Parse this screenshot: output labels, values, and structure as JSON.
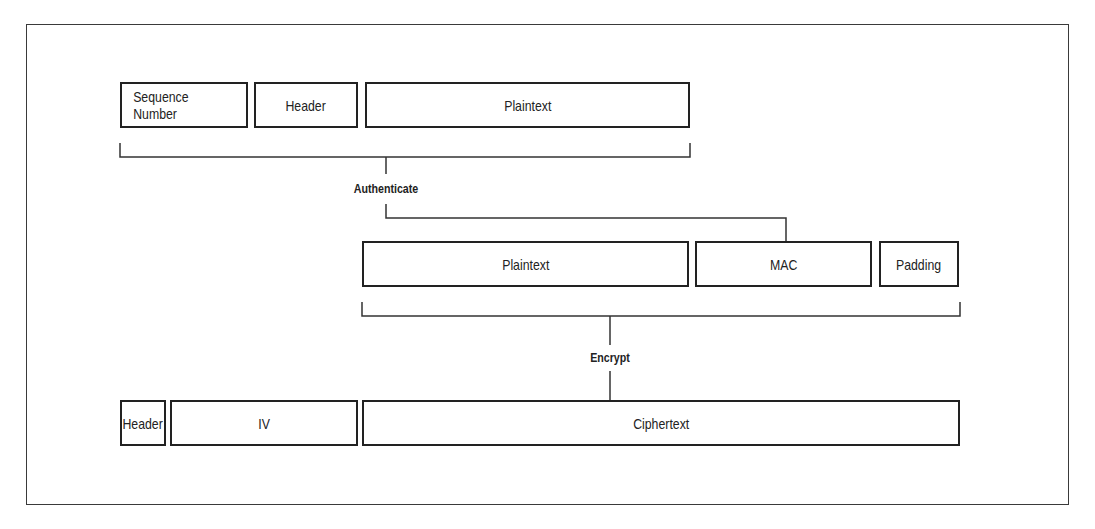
{
  "diagram": {
    "row1": {
      "fields": [
        {
          "id": "sequence-number",
          "label": "Sequence Number"
        },
        {
          "id": "header",
          "label": "Header"
        },
        {
          "id": "plaintext",
          "label": "Plaintext"
        }
      ]
    },
    "step1": {
      "label": "Authenticate"
    },
    "row2": {
      "fields": [
        {
          "id": "plaintext",
          "label": "Plaintext"
        },
        {
          "id": "mac",
          "label": "MAC"
        },
        {
          "id": "padding",
          "label": "Padding"
        }
      ]
    },
    "step2": {
      "label": "Encrypt"
    },
    "row3": {
      "fields": [
        {
          "id": "header",
          "label": "Header"
        },
        {
          "id": "iv",
          "label": "IV"
        },
        {
          "id": "ciphertext",
          "label": "Ciphertext"
        }
      ]
    },
    "colors": {
      "stroke": "#222222",
      "background": "#ffffff"
    }
  }
}
